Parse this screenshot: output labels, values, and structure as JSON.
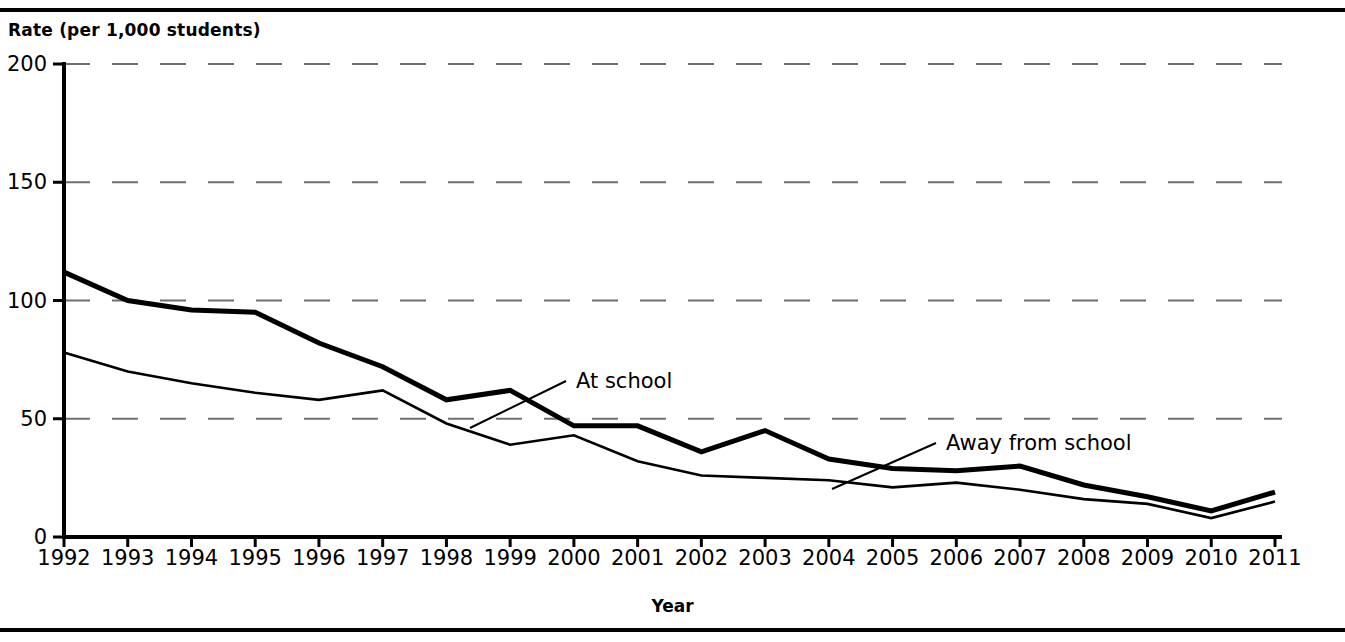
{
  "chart_data": {
    "type": "line",
    "title": "",
    "xlabel": "Year",
    "ylabel": "Rate (per 1,000 students)",
    "xlim": [
      1992,
      2011
    ],
    "ylim": [
      0,
      200
    ],
    "grid": "horizontal-dashed",
    "legend_position": "inline-annotations",
    "categories": [
      1992,
      1993,
      1994,
      1995,
      1996,
      1997,
      1998,
      1999,
      2000,
      2001,
      2002,
      2003,
      2004,
      2005,
      2006,
      2007,
      2008,
      2009,
      2010,
      2011
    ],
    "ytick_labels": [
      "0",
      "50",
      "100",
      "150",
      "200"
    ],
    "ytick_values": [
      0,
      50,
      100,
      150,
      200
    ],
    "xtick_labels": [
      "1992",
      "1993",
      "1994",
      "1995",
      "1996",
      "1997",
      "1998",
      "1999",
      "2000",
      "2001",
      "2002",
      "2003",
      "2004",
      "2005",
      "2006",
      "2007",
      "2008",
      "2009",
      "2010",
      "2011"
    ],
    "series": [
      {
        "name": "At school",
        "label": "At school",
        "style": "thick",
        "values": [
          112,
          100,
          96,
          95,
          82,
          72,
          58,
          62,
          47,
          47,
          36,
          45,
          33,
          29,
          28,
          30,
          22,
          17,
          11,
          19
        ]
      },
      {
        "name": "Away from school",
        "label": "Away from school",
        "style": "thin",
        "values": [
          78,
          70,
          65,
          61,
          58,
          62,
          48,
          39,
          43,
          32,
          26,
          25,
          24,
          21,
          23,
          20,
          16,
          14,
          8,
          15
        ]
      }
    ]
  },
  "axis": {
    "y_title": "Rate (per 1,000 students)",
    "x_title": "Year"
  },
  "annotations": {
    "at_school": "At school",
    "away_from_school": "Away from school"
  }
}
